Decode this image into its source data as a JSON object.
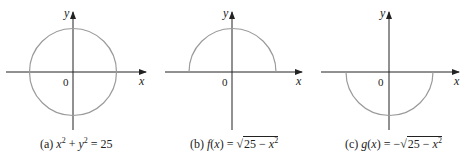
{
  "figure": {
    "panels": [
      {
        "id": "a",
        "caption_prefix": "(a)",
        "equation": "x² + y² = 25",
        "curve": "full circle",
        "y_axis_label": "y",
        "x_axis_label": "x",
        "origin_label": "0"
      },
      {
        "id": "b",
        "caption_prefix": "(b)",
        "equation": "f(x) = √(25 − x²)",
        "curve": "upper semicircle",
        "y_axis_label": "y",
        "x_axis_label": "x",
        "origin_label": "0"
      },
      {
        "id": "c",
        "caption_prefix": "(c)",
        "equation": "g(x) = −√(25 − x²)",
        "curve": "lower semicircle",
        "y_axis_label": "y",
        "x_axis_label": "x",
        "origin_label": "0"
      }
    ],
    "colors": {
      "axis": "#222222",
      "curve": "#9a9a9a"
    }
  }
}
